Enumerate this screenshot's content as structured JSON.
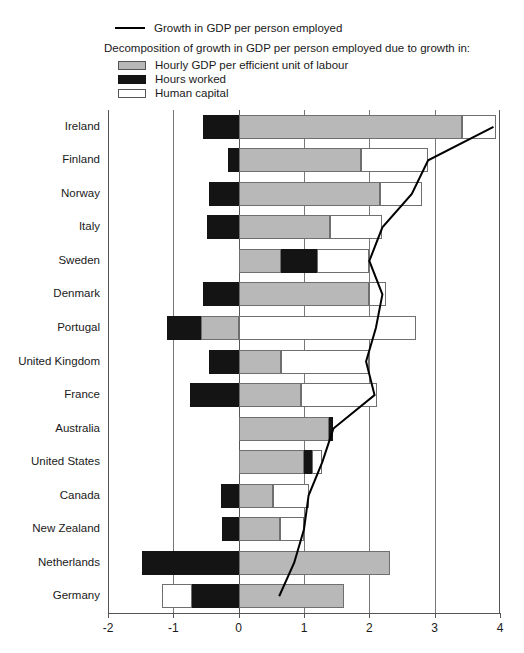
{
  "chart_data": {
    "type": "bar",
    "orientation": "horizontal",
    "stacked": true,
    "title": "",
    "xlabel": "",
    "ylabel": "",
    "xlim": [
      -2,
      4
    ],
    "xticks": [
      "-2",
      "-1",
      "0",
      "1",
      "2",
      "3",
      "4"
    ],
    "xtick_values": [
      -2,
      -1,
      0,
      1,
      2,
      3,
      4
    ],
    "grid": true,
    "grid_axis": "x",
    "legend_position": "top",
    "legend": {
      "line_label": "Growth in GDP per person employed",
      "heading": "Decomposition of growth in GDP per person employed due to growth in:",
      "items": [
        {
          "label": "Hourly GDP per efficient unit of labour",
          "color": "#b8b8b8",
          "key": "hourly_gdp"
        },
        {
          "label": "Hours worked",
          "color": "#141414",
          "key": "hours_worked"
        },
        {
          "label": "Human capital",
          "color": "#ffffff",
          "key": "human_capital"
        }
      ]
    },
    "categories": [
      "Ireland",
      "Finland",
      "Norway",
      "Italy",
      "Sweden",
      "Denmark",
      "Portugal",
      "United Kingdom",
      "France",
      "Australia",
      "United States",
      "Canada",
      "New Zealand",
      "Netherlands",
      "Germany"
    ],
    "series": [
      {
        "name": "Hourly GDP per efficient unit of labour",
        "values": [
          3.42,
          1.87,
          2.17,
          1.4,
          0.65,
          2.0,
          0.58,
          0.65,
          0.95,
          1.38,
          1.0,
          0.52,
          0.63,
          2.32,
          1.62
        ]
      },
      {
        "name": "Hours worked",
        "values": [
          -0.54,
          -0.17,
          -0.46,
          -0.48,
          0.55,
          -0.55,
          -0.52,
          -0.45,
          -0.75,
          0.07,
          0.12,
          -0.27,
          -0.25,
          -1.48,
          -0.72
        ]
      },
      {
        "name": "Human capital",
        "values": [
          0.52,
          1.03,
          0.63,
          0.8,
          0.8,
          0.25,
          2.72,
          1.35,
          1.17,
          0.0,
          0.16,
          0.55,
          0.37,
          0.0,
          -0.46
        ]
      }
    ],
    "line_series": {
      "name": "Growth in GDP per person employed",
      "values": [
        3.9,
        2.9,
        2.65,
        2.2,
        2.0,
        2.2,
        2.1,
        1.95,
        2.08,
        1.45,
        1.28,
        1.07,
        1.0,
        0.85,
        0.62
      ]
    },
    "segment_order": [
      {
        "country": "Ireland",
        "segments": [
          {
            "key": "hours_worked",
            "from": -0.54,
            "to": 0.0
          },
          {
            "key": "hourly_gdp",
            "from": 0.0,
            "to": 3.42
          },
          {
            "key": "human_capital",
            "from": 3.42,
            "to": 3.94
          }
        ]
      },
      {
        "country": "Finland",
        "segments": [
          {
            "key": "hours_worked",
            "from": -0.17,
            "to": 0.0
          },
          {
            "key": "hourly_gdp",
            "from": 0.0,
            "to": 1.87
          },
          {
            "key": "human_capital",
            "from": 1.87,
            "to": 2.9
          }
        ]
      },
      {
        "country": "Norway",
        "segments": [
          {
            "key": "hours_worked",
            "from": -0.46,
            "to": 0.0
          },
          {
            "key": "hourly_gdp",
            "from": 0.0,
            "to": 2.17
          },
          {
            "key": "human_capital",
            "from": 2.17,
            "to": 2.8
          }
        ]
      },
      {
        "country": "Italy",
        "segments": [
          {
            "key": "hours_worked",
            "from": -0.48,
            "to": 0.0
          },
          {
            "key": "hourly_gdp",
            "from": 0.0,
            "to": 1.4
          },
          {
            "key": "human_capital",
            "from": 1.4,
            "to": 2.2
          }
        ]
      },
      {
        "country": "Sweden",
        "segments": [
          {
            "key": "hourly_gdp",
            "from": 0.0,
            "to": 0.65
          },
          {
            "key": "hours_worked",
            "from": 0.65,
            "to": 1.2
          },
          {
            "key": "human_capital",
            "from": 1.2,
            "to": 2.0
          }
        ]
      },
      {
        "country": "Denmark",
        "segments": [
          {
            "key": "hours_worked",
            "from": -0.55,
            "to": 0.0
          },
          {
            "key": "hourly_gdp",
            "from": 0.0,
            "to": 2.0
          },
          {
            "key": "human_capital",
            "from": 2.0,
            "to": 2.25
          }
        ]
      },
      {
        "country": "Portugal",
        "segments": [
          {
            "key": "hours_worked",
            "from": -1.1,
            "to": -0.58
          },
          {
            "key": "hourly_gdp",
            "from": -0.58,
            "to": 0.0
          },
          {
            "key": "human_capital",
            "from": 0.0,
            "to": 2.72
          }
        ]
      },
      {
        "country": "United Kingdom",
        "segments": [
          {
            "key": "hours_worked",
            "from": -0.45,
            "to": 0.0
          },
          {
            "key": "hourly_gdp",
            "from": 0.0,
            "to": 0.65
          },
          {
            "key": "human_capital",
            "from": 0.65,
            "to": 2.0
          }
        ]
      },
      {
        "country": "France",
        "segments": [
          {
            "key": "hours_worked",
            "from": -0.75,
            "to": 0.0
          },
          {
            "key": "hourly_gdp",
            "from": 0.0,
            "to": 0.95
          },
          {
            "key": "human_capital",
            "from": 0.95,
            "to": 2.12
          }
        ]
      },
      {
        "country": "Australia",
        "segments": [
          {
            "key": "hourly_gdp",
            "from": 0.0,
            "to": 1.38
          },
          {
            "key": "hours_worked",
            "from": 1.38,
            "to": 1.45
          }
        ]
      },
      {
        "country": "United States",
        "segments": [
          {
            "key": "hourly_gdp",
            "from": 0.0,
            "to": 1.0
          },
          {
            "key": "hours_worked",
            "from": 1.0,
            "to": 1.12
          },
          {
            "key": "human_capital",
            "from": 1.12,
            "to": 1.28
          }
        ]
      },
      {
        "country": "Canada",
        "segments": [
          {
            "key": "hours_worked",
            "from": -0.27,
            "to": 0.0
          },
          {
            "key": "hourly_gdp",
            "from": 0.0,
            "to": 0.52
          },
          {
            "key": "human_capital",
            "from": 0.52,
            "to": 1.07
          }
        ]
      },
      {
        "country": "New Zealand",
        "segments": [
          {
            "key": "hours_worked",
            "from": -0.25,
            "to": 0.0
          },
          {
            "key": "hourly_gdp",
            "from": 0.0,
            "to": 0.63
          },
          {
            "key": "human_capital",
            "from": 0.63,
            "to": 1.0
          }
        ]
      },
      {
        "country": "Netherlands",
        "segments": [
          {
            "key": "hours_worked",
            "from": -1.48,
            "to": 0.0
          },
          {
            "key": "hourly_gdp",
            "from": 0.0,
            "to": 2.32
          }
        ]
      },
      {
        "country": "Germany",
        "segments": [
          {
            "key": "human_capital",
            "from": -1.18,
            "to": -0.72
          },
          {
            "key": "hours_worked",
            "from": -0.72,
            "to": 0.0
          },
          {
            "key": "hourly_gdp",
            "from": 0.0,
            "to": 1.62
          }
        ]
      }
    ]
  }
}
